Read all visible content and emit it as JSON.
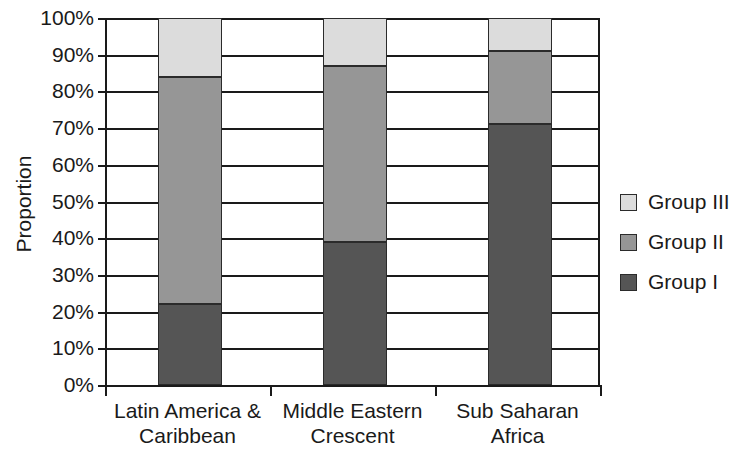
{
  "chart_data": {
    "type": "bar",
    "subtype": "stacked-bar-100-percent",
    "title": "",
    "xlabel": "",
    "ylabel": "Proportion",
    "ylim": [
      0,
      100
    ],
    "y_tick_labels": [
      "100%",
      "90%",
      "80%",
      "70%",
      "60%",
      "50%",
      "40%",
      "30%",
      "20%",
      "10%",
      "0%"
    ],
    "y_tick_values": [
      100,
      90,
      80,
      70,
      60,
      50,
      40,
      30,
      20,
      10,
      0
    ],
    "grid": true,
    "legend_position": "right",
    "categories": [
      "Latin America & Caribbean",
      "Middle Eastern Crescent",
      "Sub Saharan Africa"
    ],
    "category_lines": [
      [
        "Latin America &",
        "Caribbean"
      ],
      [
        "Middle Eastern",
        "Crescent"
      ],
      [
        "Sub Saharan",
        "Africa"
      ]
    ],
    "series": [
      {
        "name": "Group I",
        "color": "#555555",
        "values": [
          22,
          39,
          71
        ]
      },
      {
        "name": "Group II",
        "color": "#969696",
        "values": [
          62,
          48,
          20
        ]
      },
      {
        "name": "Group III",
        "color": "#dcdcdc",
        "values": [
          16,
          13,
          9
        ]
      }
    ],
    "cumulative_tops": [
      {
        "category": "Latin America & Caribbean",
        "group_i_top": 22,
        "group_ii_top": 84,
        "group_iii_top": 100
      },
      {
        "category": "Middle Eastern Crescent",
        "group_i_top": 39,
        "group_ii_top": 87,
        "group_iii_top": 100
      },
      {
        "category": "Sub Saharan Africa",
        "group_i_top": 71,
        "group_ii_top": 91,
        "group_iii_top": 100
      }
    ]
  },
  "legend": {
    "entries": [
      {
        "label": "Group III",
        "color": "#dcdcdc"
      },
      {
        "label": "Group II",
        "color": "#969696"
      },
      {
        "label": "Group I",
        "color": "#555555"
      }
    ]
  },
  "axis": {
    "y_title": "Proportion"
  }
}
